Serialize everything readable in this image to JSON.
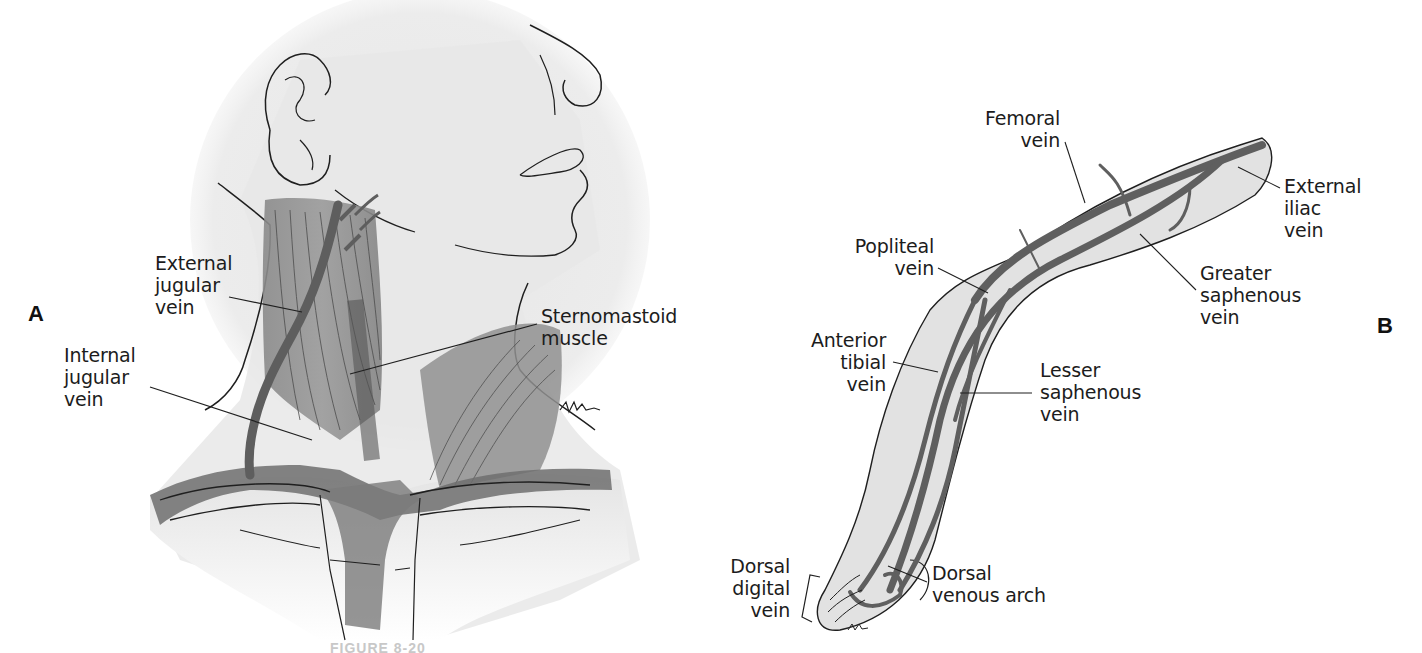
{
  "figure": {
    "caption_partial": "FIGURE 8-20",
    "colors": {
      "background": "#ffffff",
      "skin_shade": "#e3e3e3",
      "vein": "#6a6a6a",
      "muscle": "#8c8c8c",
      "outline": "#1f1f1f",
      "label_text": "#1c1c1c"
    }
  },
  "panel_a": {
    "letter": "A",
    "subject": "neck",
    "labels": {
      "external_jugular": [
        "External",
        "jugular",
        "vein"
      ],
      "internal_jugular": [
        "Internal",
        "jugular",
        "vein"
      ],
      "sternomastoid": [
        "Sternomastoid",
        "muscle"
      ]
    },
    "signature": "BATISTA"
  },
  "panel_b": {
    "letter": "B",
    "subject": "leg",
    "labels": {
      "femoral": [
        "Femoral",
        "vein"
      ],
      "external_iliac": [
        "External",
        "iliac",
        "vein"
      ],
      "popliteal": [
        "Popliteal",
        "vein"
      ],
      "greater_saphenous": [
        "Greater",
        "saphenous",
        "vein"
      ],
      "anterior_tibial": [
        "Anterior",
        "tibial",
        "vein"
      ],
      "lesser_saphenous": [
        "Lesser",
        "saphenous",
        "vein"
      ],
      "dorsal_digital": [
        "Dorsal",
        "digital",
        "vein"
      ],
      "dorsal_venous_arch": [
        "Dorsal",
        "venous arch"
      ]
    },
    "signature": "BATISTA"
  }
}
